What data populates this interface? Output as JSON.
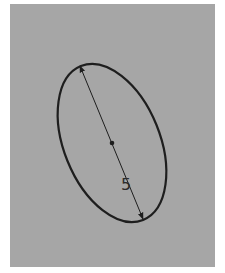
{
  "diagram": {
    "type": "sketch-ellipse-with-dimension",
    "background_color": "#a6a6a6",
    "stroke_color": "#1e1e1e",
    "ellipse": {
      "center": [
        112,
        143
      ],
      "semi_major": 83,
      "semi_minor": 48,
      "rotation_deg": -22
    },
    "dimension": {
      "label": "5",
      "start": [
        80,
        66
      ],
      "end": [
        143,
        219
      ],
      "label_position": [
        126,
        189
      ]
    },
    "center_point": [
      112,
      143
    ]
  }
}
